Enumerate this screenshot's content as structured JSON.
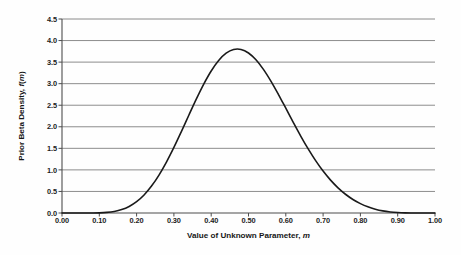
{
  "chart_data": {
    "type": "line",
    "title": "",
    "xlabel": "Value of Unknown Parameter, m",
    "xlabel_prefix": "Value of Unknown Parameter, ",
    "xlabel_var": "m",
    "ylabel": "Prior Beta Density, f(m)",
    "ylabel_prefix": "Prior Beta Density, ",
    "ylabel_var_f": "f",
    "ylabel_paren_open": "(",
    "ylabel_var_m": "m",
    "ylabel_paren_close": ")",
    "xlim": [
      0.0,
      1.0
    ],
    "ylim": [
      0.0,
      4.5
    ],
    "xticks": [
      0.0,
      0.1,
      0.2,
      0.3,
      0.4,
      0.5,
      0.6,
      0.7,
      0.8,
      0.9,
      1.0
    ],
    "xtick_labels": [
      "0.00",
      "0.10",
      "0.20",
      "0.30",
      "0.40",
      "0.50",
      "0.60",
      "0.70",
      "0.80",
      "0.90",
      "1.00"
    ],
    "yticks": [
      0.0,
      0.5,
      1.0,
      1.5,
      2.0,
      2.5,
      3.0,
      3.5,
      4.0,
      4.5
    ],
    "ytick_labels": [
      "0.0",
      "0.5",
      "1.0",
      "1.5",
      "2.0",
      "2.5",
      "3.0",
      "3.5",
      "4.0",
      "4.5"
    ],
    "grid": "horizontal",
    "legend": "none",
    "series": [
      {
        "name": "Prior Beta Density",
        "distribution": "Beta",
        "alpha": 10,
        "beta": 8,
        "peak_x": 0.5625,
        "peak_y": 3.92,
        "color": "#1a1a1a",
        "line_width": 1.6,
        "x": [
          0.0,
          0.02,
          0.04,
          0.06,
          0.08,
          0.1,
          0.12,
          0.14,
          0.16,
          0.18,
          0.2,
          0.22,
          0.24,
          0.26,
          0.28,
          0.3,
          0.32,
          0.34,
          0.36,
          0.38,
          0.4,
          0.42,
          0.44,
          0.46,
          0.48,
          0.5,
          0.52,
          0.54,
          0.56,
          0.58,
          0.6,
          0.62,
          0.64,
          0.66,
          0.68,
          0.7,
          0.72,
          0.74,
          0.76,
          0.78,
          0.8,
          0.82,
          0.84,
          0.86,
          0.88,
          0.9,
          0.92,
          0.94,
          0.96,
          0.98,
          1.0
        ],
        "y": [
          0.0,
          0.0,
          0.0,
          0.0,
          0.001,
          0.004,
          0.014,
          0.036,
          0.079,
          0.152,
          0.263,
          0.419,
          0.625,
          0.88,
          1.181,
          1.521,
          1.888,
          2.267,
          2.64,
          2.989,
          3.293,
          3.537,
          3.706,
          3.793,
          3.794,
          3.712,
          3.554,
          3.332,
          3.06,
          2.754,
          2.43,
          2.102,
          1.784,
          1.486,
          1.214,
          0.972,
          0.762,
          0.584,
          0.435,
          0.314,
          0.218,
          0.143,
          0.088,
          0.049,
          0.024,
          0.01,
          0.003,
          0.001,
          0.0,
          0.0,
          0.0
        ]
      }
    ],
    "axis_colors": {
      "gridline": "#808080",
      "axis_line": "#4d4d4d",
      "curve": "#1a1a1a",
      "text": "#1c1c1c",
      "background": "#fefefe"
    }
  }
}
